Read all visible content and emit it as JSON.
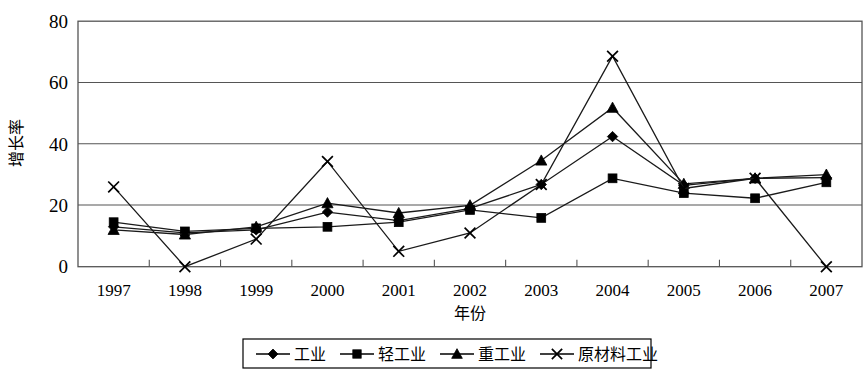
{
  "chart_data": {
    "type": "line",
    "title": "",
    "xlabel": "年份",
    "ylabel": "增长率",
    "categories": [
      "1997",
      "1998",
      "1999",
      "2000",
      "2001",
      "2002",
      "2003",
      "2004",
      "2005",
      "2006",
      "2007"
    ],
    "ylim": [
      0,
      80
    ],
    "yticks": [
      0,
      20,
      40,
      60,
      80
    ],
    "grid": true,
    "legend_position": "bottom",
    "series": [
      {
        "name": "工业",
        "marker": "diamond",
        "values": [
          13,
          11,
          12,
          17.8,
          15,
          19,
          26.8,
          42.4,
          26.5,
          28.8,
          29
        ]
      },
      {
        "name": "轻工业",
        "marker": "square",
        "values": [
          14.5,
          11.5,
          12.5,
          13,
          14.5,
          18.5,
          15.9,
          28.8,
          24,
          22.3,
          27.5
        ]
      },
      {
        "name": "重工业",
        "marker": "triangle",
        "values": [
          12,
          10.5,
          13,
          20.7,
          17.5,
          20,
          34.6,
          51.8,
          27,
          28.8,
          30
        ]
      },
      {
        "name": "原材料工业",
        "marker": "x",
        "values": [
          26,
          0,
          9,
          34.3,
          5,
          11,
          26.8,
          68.6,
          25.5,
          28.8,
          0
        ]
      }
    ]
  },
  "axis": {
    "y_label": "增长率",
    "x_label": "年份"
  },
  "legend": {
    "items": [
      {
        "label": "工业",
        "marker": "diamond-marker"
      },
      {
        "label": "轻工业",
        "marker": "square-marker"
      },
      {
        "label": "重工业",
        "marker": "triangle-marker"
      },
      {
        "label": "原材料工业",
        "marker": "x-marker"
      }
    ]
  }
}
